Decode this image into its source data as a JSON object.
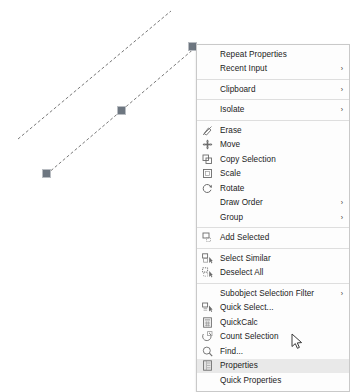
{
  "app": {
    "name": "CAD drawing editor",
    "background_color": "#ffffff"
  },
  "drawing": {
    "name": "drawing-canvas",
    "line_color": "#5a5a5a",
    "line_style": "dashed",
    "entities": [
      {
        "name": "line-upper",
        "x1": 18,
        "y1": 139,
        "x2": 171,
        "y2": 11,
        "selected": false
      },
      {
        "name": "line-lower",
        "x1": 47,
        "y1": 174,
        "x2": 196,
        "y2": 47,
        "selected": true
      }
    ],
    "grips": [
      {
        "name": "grip-start",
        "x": 42,
        "y": 169,
        "color": "#6d7680"
      },
      {
        "name": "grip-midpoint",
        "x": 117,
        "y": 106,
        "color": "#6d7680"
      },
      {
        "name": "grip-end",
        "x": 188,
        "y": 42,
        "color": "#6d7680"
      }
    ]
  },
  "context_menu": {
    "name": "object-context-menu",
    "highlight_color": "#e9e9e9",
    "background_color": "#fdfdfd",
    "border_color": "#c9c9c9",
    "submenu_arrow": "›",
    "groups": [
      {
        "name": "group-repeat",
        "items": [
          {
            "label": "Repeat Properties",
            "icon": "",
            "submenu": false,
            "highlighted": false
          },
          {
            "label": "Recent Input",
            "icon": "",
            "submenu": true,
            "highlighted": false
          }
        ]
      },
      {
        "name": "group-clipboard",
        "items": [
          {
            "label": "Clipboard",
            "icon": "",
            "submenu": true,
            "highlighted": false
          }
        ]
      },
      {
        "name": "group-isolate",
        "items": [
          {
            "label": "Isolate",
            "icon": "",
            "submenu": true,
            "highlighted": false
          }
        ]
      },
      {
        "name": "group-modify",
        "items": [
          {
            "label": "Erase",
            "icon": "eraser-icon",
            "submenu": false,
            "highlighted": false
          },
          {
            "label": "Move",
            "icon": "move-cross-icon",
            "submenu": false,
            "highlighted": false
          },
          {
            "label": "Copy Selection",
            "icon": "copy-selection-icon",
            "submenu": false,
            "highlighted": false
          },
          {
            "label": "Scale",
            "icon": "scale-square-icon",
            "submenu": false,
            "highlighted": false
          },
          {
            "label": "Rotate",
            "icon": "rotate-arrow-icon",
            "submenu": false,
            "highlighted": false
          },
          {
            "label": "Draw Order",
            "icon": "",
            "submenu": true,
            "highlighted": false
          },
          {
            "label": "Group",
            "icon": "",
            "submenu": true,
            "highlighted": false
          }
        ]
      },
      {
        "name": "group-add-selected",
        "items": [
          {
            "label": "Add Selected",
            "icon": "add-selected-icon",
            "submenu": false,
            "highlighted": false
          }
        ]
      },
      {
        "name": "group-selection",
        "items": [
          {
            "label": "Select Similar",
            "icon": "select-similar-icon",
            "submenu": false,
            "highlighted": false
          },
          {
            "label": "Deselect All",
            "icon": "deselect-all-icon",
            "submenu": false,
            "highlighted": false
          }
        ]
      },
      {
        "name": "group-tools",
        "items": [
          {
            "label": "Subobject Selection Filter",
            "icon": "",
            "submenu": true,
            "highlighted": false
          },
          {
            "label": "Quick Select...",
            "icon": "quick-select-icon",
            "submenu": false,
            "highlighted": false
          },
          {
            "label": "QuickCalc",
            "icon": "calculator-icon",
            "submenu": false,
            "highlighted": false
          },
          {
            "label": "Count Selection",
            "icon": "count-selection-icon",
            "submenu": false,
            "highlighted": false
          },
          {
            "label": "Find...",
            "icon": "magnifier-icon",
            "submenu": false,
            "highlighted": false
          },
          {
            "label": "Properties",
            "icon": "properties-icon",
            "submenu": false,
            "highlighted": true
          },
          {
            "label": "Quick Properties",
            "icon": "",
            "submenu": false,
            "highlighted": false
          }
        ]
      }
    ]
  },
  "cursor": {
    "name": "mouse-pointer",
    "x": 291,
    "y": 333
  }
}
